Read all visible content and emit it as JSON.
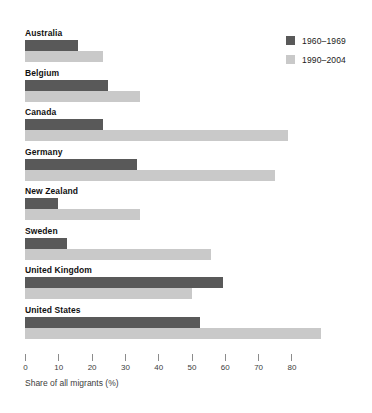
{
  "chart_data": {
    "type": "bar",
    "orientation": "horizontal",
    "title": "",
    "xlabel": "Share of all migrants (%)",
    "ylabel": "",
    "xlim": [
      0,
      90
    ],
    "xticks": [
      0,
      10,
      20,
      30,
      40,
      50,
      60,
      70,
      80
    ],
    "xticklabels": [
      "0",
      "10",
      "20",
      "30",
      "40",
      "50",
      "60",
      "70",
      "80"
    ],
    "grid": false,
    "legend_position": "top-right",
    "categories": [
      "Australia",
      "Belgium",
      "Canada",
      "Germany",
      "New Zealand",
      "Sweden",
      "United Kingdom",
      "United States"
    ],
    "series": [
      {
        "name": "1960–1969",
        "color": "#595959",
        "values": [
          16,
          25,
          23.5,
          33.5,
          10,
          12.5,
          59.5,
          52.5
        ]
      },
      {
        "name": "1990–2004",
        "color": "#c9c9c9",
        "values": [
          23.5,
          34.5,
          79,
          75,
          34.5,
          56,
          50,
          89
        ]
      }
    ]
  },
  "legend": {
    "items": [
      {
        "label": "1960–1969",
        "color": "#595959"
      },
      {
        "label": "1990–2004",
        "color": "#c9c9c9"
      }
    ]
  },
  "axis": {
    "title": "Share of all migrants (%)"
  }
}
